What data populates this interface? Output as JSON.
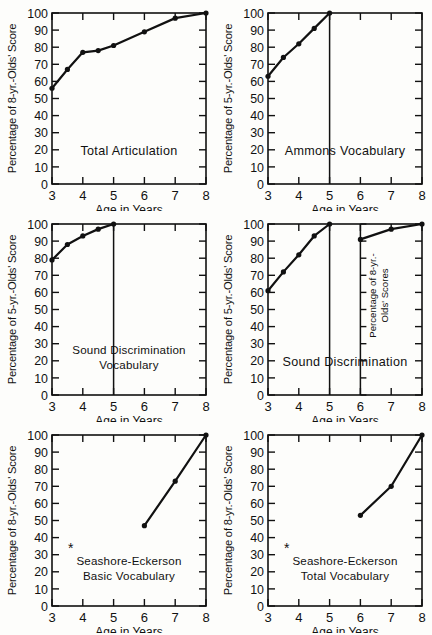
{
  "figure": {
    "background": "#fdfdfb",
    "ink": "#111111",
    "panel_count": 6,
    "shared_xlabel": "Age in Years",
    "shared_xticks": [
      "3",
      "4",
      "5",
      "6",
      "7",
      "8"
    ],
    "shared_yticks": [
      "0",
      "10",
      "20",
      "30",
      "40",
      "50",
      "60",
      "70",
      "80",
      "90",
      "100"
    ]
  },
  "chart_data": [
    {
      "id": "total-articulation",
      "type": "line",
      "title": "Total Articulation",
      "xlabel": "Age in Years",
      "ylabel": "Percentage of 8-yr.-Olds' Score",
      "xlim": [
        3,
        8
      ],
      "ylim": [
        0,
        100
      ],
      "xticks": [
        3,
        4,
        5,
        6,
        7,
        8
      ],
      "yticks": [
        0,
        10,
        20,
        30,
        40,
        50,
        60,
        70,
        80,
        90,
        100
      ],
      "grid": false,
      "legend": "none",
      "x": [
        3.0,
        3.5,
        4.0,
        4.5,
        5.0,
        6.0,
        7.0,
        8.0
      ],
      "values": [
        56,
        67,
        77,
        78,
        81,
        89,
        97,
        100
      ]
    },
    {
      "id": "ammons-vocabulary",
      "type": "line",
      "title": "Ammons Vocabulary",
      "xlabel": "Age in Years",
      "ylabel": "Percentage of 5-yr.-Olds' Score",
      "xlim": [
        3,
        8
      ],
      "ylim": [
        0,
        100
      ],
      "xticks": [
        3,
        4,
        5,
        6,
        7,
        8
      ],
      "yticks": [
        0,
        10,
        20,
        30,
        40,
        50,
        60,
        70,
        80,
        90,
        100
      ],
      "grid": false,
      "legend": "none",
      "x": [
        3.0,
        3.5,
        4.0,
        4.5,
        5.0
      ],
      "values": [
        63,
        74,
        82,
        91,
        100
      ],
      "annotations": [
        {
          "type": "vertical-drop-line",
          "at_x": 5.0,
          "from_y": 100,
          "to_y": 0
        }
      ]
    },
    {
      "id": "sound-discrimination-vocabulary",
      "type": "line",
      "title": "Sound Discrimination Vocabulary",
      "title_line1": "Sound Discrimination",
      "title_line2": "Vocabulary",
      "xlabel": "Age in Years",
      "ylabel": "Percentage of 5-yr.-Olds' Score",
      "xlim": [
        3,
        8
      ],
      "ylim": [
        0,
        100
      ],
      "xticks": [
        3,
        4,
        5,
        6,
        7,
        8
      ],
      "yticks": [
        0,
        10,
        20,
        30,
        40,
        50,
        60,
        70,
        80,
        90,
        100
      ],
      "grid": false,
      "legend": "none",
      "x": [
        3.0,
        3.5,
        4.0,
        4.5,
        5.0
      ],
      "values": [
        79,
        88,
        93,
        97,
        100
      ],
      "annotations": [
        {
          "type": "vertical-drop-line",
          "at_x": 5.0,
          "from_y": 100,
          "to_y": 0
        }
      ]
    },
    {
      "id": "sound-discrimination",
      "type": "line",
      "title": "Sound Discrimination",
      "xlabel": "Age in Years",
      "ylabel": "Percentage of 5-yr.-Olds' Score",
      "xlim": [
        3,
        8
      ],
      "ylim": [
        0,
        100
      ],
      "xticks": [
        3,
        4,
        5,
        6,
        7,
        8
      ],
      "yticks": [
        0,
        10,
        20,
        30,
        40,
        50,
        60,
        70,
        80,
        90,
        100
      ],
      "grid": false,
      "legend": "none",
      "x": [
        3.0,
        3.5,
        4.0,
        4.5,
        5.0
      ],
      "values": [
        61,
        72,
        82,
        93,
        100
      ],
      "annotations": [
        {
          "type": "vertical-drop-line",
          "at_x": 5.0,
          "from_y": 100,
          "to_y": 0
        },
        {
          "type": "vertical-axis-line",
          "at_x": 6.0,
          "from_y": 100,
          "to_y": 0
        }
      ],
      "inset": {
        "id": "sound-discrimination-8yr-inset",
        "ylabel": "Percentage of 8-yr.-Olds' Scores",
        "ylabel_line1": "Percentage of 8-yr.-",
        "ylabel_line2": "Olds' Scores",
        "xlim": [
          6,
          8
        ],
        "ylim": [
          0,
          100
        ],
        "x": [
          6.0,
          7.0,
          8.0
        ],
        "values": [
          91,
          97,
          100
        ]
      }
    },
    {
      "id": "seashore-eckerson-basic-vocabulary",
      "type": "line",
      "title": "Seashore-Eckerson Basic Vocabulary",
      "title_line1": "Seashore-Eckerson",
      "title_line2": "Basic Vocabulary",
      "title_marker": "*",
      "xlabel": "Age in Years",
      "ylabel": "Percentage of 8-yr.-Olds' Score",
      "xlim": [
        3,
        8
      ],
      "ylim": [
        0,
        100
      ],
      "xticks": [
        3,
        4,
        5,
        6,
        7,
        8
      ],
      "yticks": [
        0,
        10,
        20,
        30,
        40,
        50,
        60,
        70,
        80,
        90,
        100
      ],
      "grid": false,
      "legend": "none",
      "x": [
        6.0,
        7.0,
        8.0
      ],
      "values": [
        47,
        73,
        100
      ]
    },
    {
      "id": "seashore-eckerson-total-vocabulary",
      "type": "line",
      "title": "Seashore-Eckerson Total Vocabulary",
      "title_line1": "Seashore-Eckerson",
      "title_line2": "Total Vocabulary",
      "title_marker": "*",
      "xlabel": "Age in Years",
      "ylabel": "Percentage of 8-yr.-Olds' Score",
      "xlim": [
        3,
        8
      ],
      "ylim": [
        0,
        100
      ],
      "xticks": [
        3,
        4,
        5,
        6,
        7,
        8
      ],
      "yticks": [
        0,
        10,
        20,
        30,
        40,
        50,
        60,
        70,
        80,
        90,
        100
      ],
      "grid": false,
      "legend": "none",
      "x": [
        6.0,
        7.0,
        8.0
      ],
      "values": [
        53,
        70,
        100
      ]
    }
  ]
}
